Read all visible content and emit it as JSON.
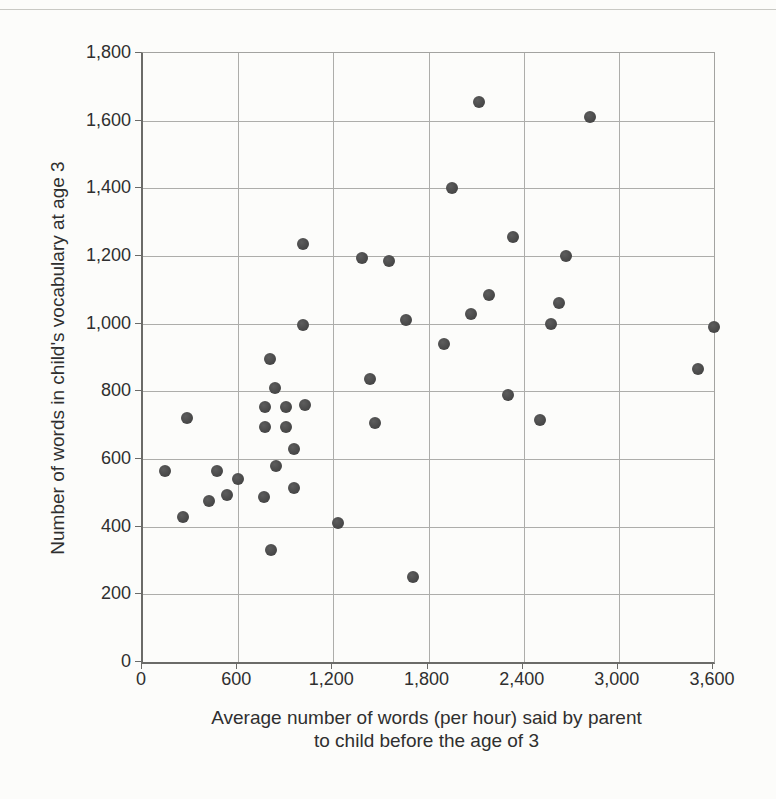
{
  "figure": {
    "background_color": "#fcfcfa",
    "top_rule_color": "#c9c9c4",
    "gridline_color": "#adadaa",
    "axis_color": "#6b6b68",
    "text_color": "#2f2f2f"
  },
  "chart_data": {
    "type": "scatter",
    "title": "",
    "xlabel_line1": "Average number of words (per hour) said by parent",
    "xlabel_line2": "to child before the age of 3",
    "ylabel": "Number of words in child's vocabulary at age 3",
    "xlim": [
      0,
      3600
    ],
    "ylim": [
      0,
      1800
    ],
    "grid": true,
    "legend_position": "none",
    "point_color": "#4d4d4d",
    "x_ticks": [
      0,
      600,
      1200,
      1800,
      2400,
      3000,
      3600
    ],
    "x_tick_labels": [
      "0",
      "600",
      "1,200",
      "1,800",
      "2,400",
      "3,000",
      "3,600"
    ],
    "y_ticks": [
      0,
      200,
      400,
      600,
      800,
      1000,
      1200,
      1400,
      1600,
      1800
    ],
    "y_tick_labels": [
      "0",
      "200",
      "400",
      "600",
      "800",
      "1,000",
      "1,200",
      "1,400",
      "1,600",
      "1,800"
    ],
    "points": [
      [
        2120,
        1655
      ],
      [
        2820,
        1610
      ],
      [
        1950,
        1400
      ],
      [
        2330,
        1255
      ],
      [
        1010,
        1235
      ],
      [
        2670,
        1200
      ],
      [
        1380,
        1195
      ],
      [
        1550,
        1185
      ],
      [
        2180,
        1085
      ],
      [
        2620,
        1060
      ],
      [
        2070,
        1030
      ],
      [
        1660,
        1010
      ],
      [
        2570,
        1000
      ],
      [
        1010,
        995
      ],
      [
        3600,
        990
      ],
      [
        1900,
        940
      ],
      [
        800,
        895
      ],
      [
        3500,
        865
      ],
      [
        1430,
        835
      ],
      [
        830,
        810
      ],
      [
        2300,
        790
      ],
      [
        1020,
        760
      ],
      [
        770,
        755
      ],
      [
        900,
        755
      ],
      [
        280,
        720
      ],
      [
        2500,
        715
      ],
      [
        1460,
        705
      ],
      [
        770,
        695
      ],
      [
        900,
        695
      ],
      [
        950,
        630
      ],
      [
        840,
        580
      ],
      [
        140,
        565
      ],
      [
        465,
        565
      ],
      [
        600,
        540
      ],
      [
        950,
        513
      ],
      [
        530,
        495
      ],
      [
        765,
        487
      ],
      [
        415,
        477
      ],
      [
        255,
        430
      ],
      [
        1230,
        412
      ],
      [
        810,
        330
      ],
      [
        1700,
        250
      ]
    ]
  }
}
